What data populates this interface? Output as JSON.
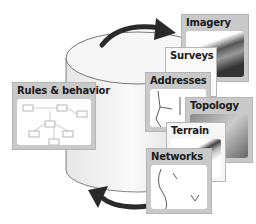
{
  "diagram": {
    "center": "database-cylinder",
    "cycle_arrows": [
      "top-arrow-clockwise",
      "bottom-arrow-clockwise"
    ],
    "cards": [
      {
        "id": "imagery",
        "label": "Imagery"
      },
      {
        "id": "surveys",
        "label": "Surveys"
      },
      {
        "id": "addresses",
        "label": "Addresses"
      },
      {
        "id": "topology",
        "label": "Topology"
      },
      {
        "id": "terrain",
        "label": "Terrain"
      },
      {
        "id": "networks",
        "label": "Networks"
      },
      {
        "id": "rules",
        "label": "Rules & behavior"
      }
    ]
  },
  "colors": {
    "card_frame": "#c9c9c9",
    "arrow": "#2a2a2a",
    "cylinder_outline": "#555555"
  }
}
